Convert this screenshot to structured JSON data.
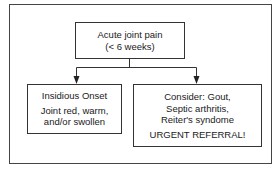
{
  "diagram": {
    "type": "flowchart",
    "colors": {
      "line": "#333333",
      "text": "#1a1a1a",
      "background": "#ffffff"
    },
    "root": {
      "line1": "Acute joint pain",
      "line2": "(< 6 weeks)"
    },
    "left_branch": {
      "title": "Insidious Onset",
      "line1": "Joint red, warm,",
      "line2": "and/or swollen"
    },
    "right_branch": {
      "line1": "Consider: Gout,",
      "line2": "Septic arthritis,",
      "line3": "Reiter's syndome",
      "action": "URGENT REFERRAL!"
    },
    "edges": [
      {
        "from": "root",
        "to": "left_branch"
      },
      {
        "from": "root",
        "to": "right_branch"
      }
    ]
  }
}
